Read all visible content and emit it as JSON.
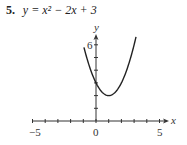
{
  "problem": {
    "number": "5.",
    "equation": "y = x² − 2x + 3"
  },
  "chart_data": {
    "type": "line",
    "function": "x^2 - 2x + 3",
    "xlabel": "x",
    "ylabel": "y",
    "xlim": [
      -5,
      5
    ],
    "ylim": [
      0,
      6
    ],
    "x_tick_labels": [
      "-5",
      "0",
      "5"
    ],
    "y_tick_labels": [
      "6"
    ],
    "x_ticks": [
      -5,
      -4,
      -3,
      -2,
      -1,
      0,
      1,
      2,
      3,
      4,
      5
    ],
    "y_ticks": [
      1,
      2,
      3,
      4,
      5,
      6
    ],
    "grid": false,
    "series": [
      {
        "name": "y = x^2 - 2x + 3",
        "x": [
          -1.0,
          -0.5,
          0,
          0.5,
          1,
          1.5,
          2,
          2.5,
          3,
          3.2
        ],
        "y": [
          6.0,
          4.25,
          3,
          2.25,
          2,
          2.25,
          3,
          4.25,
          6,
          6.84
        ]
      }
    ],
    "vertex": [
      1,
      2
    ],
    "y_intercept": 3
  },
  "labels": {
    "x_axis": "x",
    "y_axis": "y",
    "x_min": "−5",
    "x_zero": "0",
    "x_max": "5",
    "y_six": "6"
  }
}
